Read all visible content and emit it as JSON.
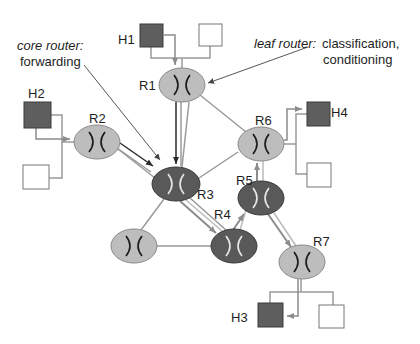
{
  "colors": {
    "edge_router_fill": "#bdbdbd",
    "core_router_fill": "#595959",
    "host_fill": "#5e5e5e",
    "host_empty_fill": "#ffffff",
    "link": "#9a9a9a",
    "flow_dark": "#2a2a2a",
    "flow_gray": "#8c8c8c",
    "callout": "#555555"
  },
  "annotations": {
    "core": {
      "title": "core router:",
      "text": "forwarding"
    },
    "leaf": {
      "title": "leaf router:",
      "text1": "classification,",
      "text2": "conditioning"
    }
  },
  "routers": {
    "r1": {
      "label": "R1",
      "type": "leaf"
    },
    "r2": {
      "label": "R2",
      "type": "leaf"
    },
    "r3": {
      "label": "R3",
      "type": "core"
    },
    "r4": {
      "label": "R4",
      "type": "core"
    },
    "r5": {
      "label": "R5",
      "type": "core"
    },
    "r6": {
      "label": "R6",
      "type": "leaf"
    },
    "r7": {
      "label": "R7",
      "type": "leaf"
    },
    "r8": {
      "label": "",
      "type": "leaf"
    }
  },
  "hosts": {
    "h1": {
      "label": "H1"
    },
    "h2": {
      "label": "H2"
    },
    "h3": {
      "label": "H3"
    },
    "h4": {
      "label": "H4"
    }
  },
  "router_glyph": "X"
}
